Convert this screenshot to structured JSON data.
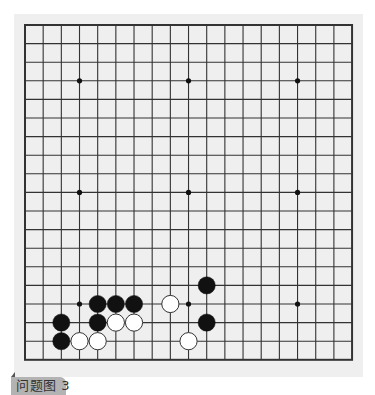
{
  "board": {
    "size": 19,
    "origin_x": 25,
    "origin_y": 25,
    "cell_w": 18.17,
    "cell_h": 18.6,
    "stone_radius": 8.6,
    "colors": {
      "background": "#efefef",
      "grid_line": "#333333",
      "black_stone": "#111111",
      "white_stone": "#ffffff",
      "white_stone_border": "#333333",
      "star_point": "#111111"
    },
    "star_points": [
      [
        3,
        3
      ],
      [
        9,
        3
      ],
      [
        15,
        3
      ],
      [
        3,
        9
      ],
      [
        9,
        9
      ],
      [
        15,
        9
      ],
      [
        3,
        15
      ],
      [
        9,
        15
      ],
      [
        15,
        15
      ]
    ],
    "stones": [
      {
        "color": "black",
        "col": 10,
        "row": 14
      },
      {
        "color": "black",
        "col": 4,
        "row": 15
      },
      {
        "color": "black",
        "col": 5,
        "row": 15
      },
      {
        "color": "black",
        "col": 6,
        "row": 15
      },
      {
        "color": "white",
        "col": 8,
        "row": 15
      },
      {
        "color": "black",
        "col": 2,
        "row": 16
      },
      {
        "color": "black",
        "col": 4,
        "row": 16
      },
      {
        "color": "white",
        "col": 5,
        "row": 16
      },
      {
        "color": "white",
        "col": 6,
        "row": 16
      },
      {
        "color": "black",
        "col": 10,
        "row": 16
      },
      {
        "color": "black",
        "col": 2,
        "row": 17
      },
      {
        "color": "white",
        "col": 3,
        "row": 17
      },
      {
        "color": "white",
        "col": 4,
        "row": 17
      },
      {
        "color": "white",
        "col": 9,
        "row": 17
      }
    ]
  },
  "caption": {
    "label": "问题图 3"
  }
}
